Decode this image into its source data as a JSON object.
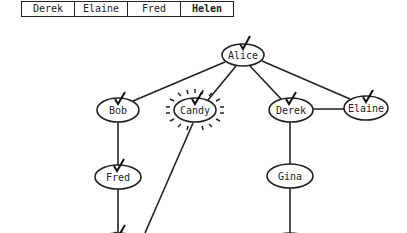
{
  "queue": {
    "items": [
      {
        "label": "Derek",
        "bold": false
      },
      {
        "label": "Elaine",
        "bold": false
      },
      {
        "label": "Fred",
        "bold": false
      },
      {
        "label": "Helen",
        "bold": true
      }
    ]
  },
  "graph": {
    "nodes": {
      "alice": {
        "label": "Alice",
        "x": 243,
        "y": 55,
        "checked": true
      },
      "bob": {
        "label": "Bob",
        "x": 118,
        "y": 110,
        "checked": true
      },
      "candy": {
        "label": "Candy",
        "x": 195,
        "y": 110,
        "checked": true,
        "highlighted": true
      },
      "derek": {
        "label": "Derek",
        "x": 291,
        "y": 110,
        "checked": true
      },
      "elaine": {
        "label": "Elaine",
        "x": 366,
        "y": 108,
        "checked": true
      },
      "fred": {
        "label": "Fred",
        "x": 118,
        "y": 177,
        "checked": true
      },
      "gina": {
        "label": "Gina",
        "x": 290,
        "y": 176,
        "checked": false
      }
    },
    "edges": [
      [
        "Alice",
        "Bob"
      ],
      [
        "Alice",
        "Candy"
      ],
      [
        "Alice",
        "Derek"
      ],
      [
        "Alice",
        "Elaine"
      ],
      [
        "Derek",
        "Elaine"
      ],
      [
        "Bob",
        "Fred"
      ],
      [
        "Derek",
        "Gina"
      ],
      [
        "Candy",
        "offscreen-bottom"
      ],
      [
        "Fred",
        "offscreen-bottom"
      ],
      [
        "Gina",
        "offscreen-bottom"
      ]
    ]
  }
}
